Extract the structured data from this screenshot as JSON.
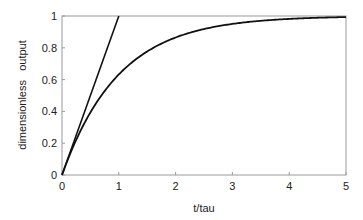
{
  "chart_data": {
    "type": "line",
    "title": "",
    "xlabel": "t/tau",
    "ylabel": "dimensionless   output",
    "xlim": [
      0,
      5
    ],
    "ylim": [
      0,
      1
    ],
    "x_ticks": [
      "0",
      "1",
      "2",
      "3",
      "4",
      "5"
    ],
    "y_ticks": [
      "0",
      "0.2",
      "0.4",
      "0.6",
      "0.8",
      "1"
    ],
    "grid": false,
    "legend": null,
    "series": [
      {
        "name": "step response 1 - exp(-t/tau)",
        "x": [
          0,
          0.25,
          0.5,
          0.75,
          1,
          1.5,
          2,
          2.5,
          3,
          3.5,
          4,
          4.5,
          5
        ],
        "values": [
          0,
          0.221,
          0.393,
          0.528,
          0.632,
          0.777,
          0.865,
          0.918,
          0.95,
          0.97,
          0.982,
          0.989,
          0.993
        ]
      },
      {
        "name": "initial slope tangent",
        "x": [
          0,
          1
        ],
        "values": [
          0,
          1
        ]
      }
    ]
  }
}
